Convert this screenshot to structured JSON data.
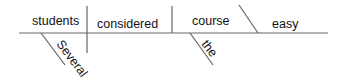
{
  "diagram": {
    "type": "sentence-diagram",
    "words": {
      "subject": "students",
      "verb": "considered",
      "object": "course",
      "complement": "easy",
      "subject_modifier": "Several",
      "object_modifier": "the"
    },
    "colors": {
      "line": "#555555",
      "text": "#111111"
    }
  }
}
